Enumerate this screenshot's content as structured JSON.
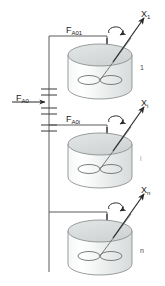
{
  "figure": {
    "kind": "process-flow-diagram",
    "background_color": "#ffffff",
    "line_color": "#3a3a3a",
    "tank_fill_color": "#eceeee",
    "tank_top_color": "#d9dcdc",
    "text_color": "#1a1a1a"
  },
  "feed": {
    "main_label_base": "F",
    "main_label_sub": "A0",
    "branches": [
      {
        "label_base": "F",
        "label_sub": "A01"
      },
      {
        "label_base": "F",
        "label_sub": "A0i"
      }
    ]
  },
  "reactors": [
    {
      "index_label": "1",
      "outlet_base": "X",
      "outlet_sub": "1",
      "agitator": "stirrer-icon",
      "rotation": "rotation-arrow-icon"
    },
    {
      "index_label": "i",
      "outlet_base": "X",
      "outlet_sub": "i",
      "agitator": "stirrer-icon",
      "rotation": "rotation-arrow-icon"
    },
    {
      "index_label": "n",
      "outlet_base": "X",
      "outlet_sub": "n",
      "agitator": "stirrer-icon",
      "rotation": "rotation-arrow-icon"
    }
  ]
}
